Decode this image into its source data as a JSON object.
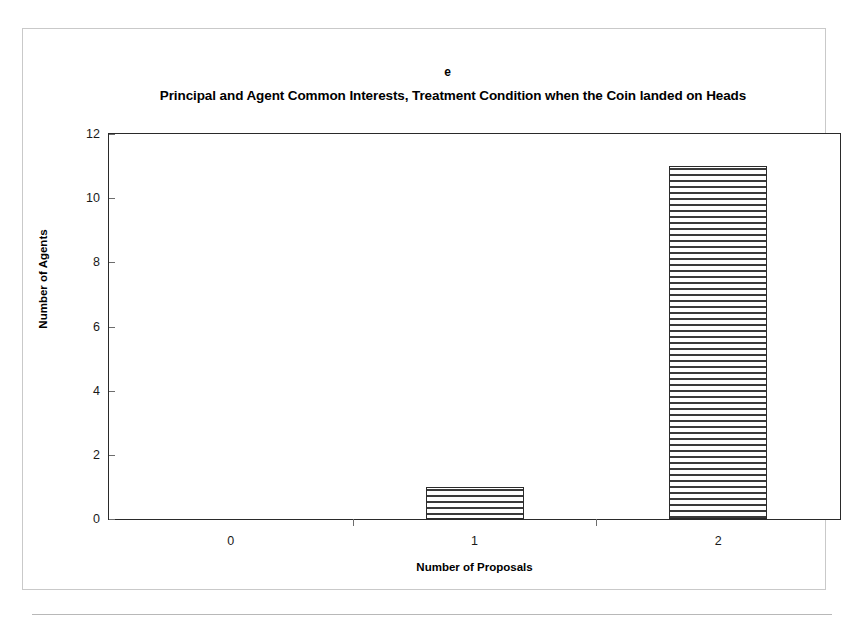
{
  "figure": {
    "panel_letter": "e",
    "title": "Principal and Agent Common Interests, Treatment Condition when the Coin landed on Heads"
  },
  "chart_data": {
    "type": "bar",
    "title": "Principal and Agent Common Interests, Treatment Condition when the Coin landed on Heads",
    "panel_label": "e",
    "categories": [
      "0",
      "1",
      "2"
    ],
    "values": [
      0,
      1,
      11
    ],
    "xlabel": "Number of Proposals",
    "ylabel": "Number of Agents",
    "ylim": [
      0,
      12
    ],
    "ytick_labels": [
      "0",
      "2",
      "4",
      "6",
      "8",
      "10",
      "12"
    ],
    "ytick_values": [
      0,
      2,
      4,
      6,
      8,
      10,
      12
    ],
    "grid": false,
    "legend": false,
    "series_fill": "horizontal-hatch",
    "colors": {
      "bar_outline": "#2b2b2b",
      "bar_hatch": "#3a3a3a",
      "bar_background": "#ffffff",
      "axis": "#2a2a2a",
      "text": "#000000",
      "page_background": "#ffffff",
      "frame_border": "#c9c9c9"
    }
  }
}
